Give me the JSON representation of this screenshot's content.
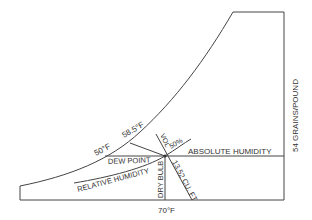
{
  "diagram": {
    "labels": {
      "dew_point_temp": "50°F",
      "wet_bulb_temp": "58.5°F",
      "dew_point": "DEW POINT",
      "relative_humidity": "RELATIVE HUMIDITY",
      "dry_bulb": "DRY BULB",
      "dry_bulb_temp": "70°F",
      "volume": "VOL",
      "rh_value": "50%",
      "specific_volume": "13.52 CU. FT",
      "absolute_humidity": "ABSOLUTE HUMIDITY",
      "grains": "54 GRAINS/POUND"
    },
    "colors": {
      "line": "#444444",
      "text": "#333333",
      "background": "#ffffff"
    }
  }
}
